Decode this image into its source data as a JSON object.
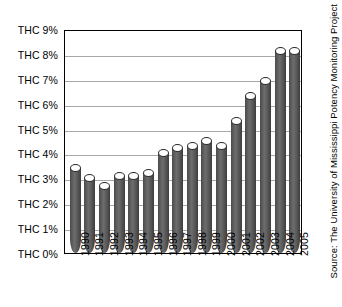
{
  "chart_data": {
    "type": "bar",
    "title": "",
    "xlabel": "",
    "ylabel": "",
    "categories": [
      "1990",
      "1991",
      "1992",
      "1993",
      "1994",
      "1995",
      "1996",
      "1997",
      "1998",
      "1999",
      "2000",
      "2001",
      "2002",
      "2003",
      "2004",
      "2005"
    ],
    "values": [
      3.4,
      3.0,
      2.7,
      3.1,
      3.1,
      3.2,
      4.0,
      4.2,
      4.3,
      4.5,
      4.3,
      5.3,
      6.3,
      6.9,
      8.1,
      8.1
    ],
    "ylim": [
      0,
      9
    ],
    "yticks": [
      0,
      1,
      2,
      3,
      4,
      5,
      6,
      7,
      8,
      9
    ],
    "ytick_labels": [
      "THC 0%",
      "THC 1%",
      "THC 2%",
      "THC 3%",
      "THC 4%",
      "THC 5%",
      "THC 6%",
      "THC 7%",
      "THC 8%",
      "THC 9%"
    ],
    "grid": true,
    "legend": "none",
    "series_name": "THC potency",
    "bar_color": "#5a5a5a",
    "grid_color": "#a8a8a8",
    "axis_color": "#000000",
    "annotation": "Source: The University of Mississippi Potency Monitoring Project"
  },
  "source": {
    "text": "Source: The University of Mississippi Potency Monitoring Project"
  }
}
